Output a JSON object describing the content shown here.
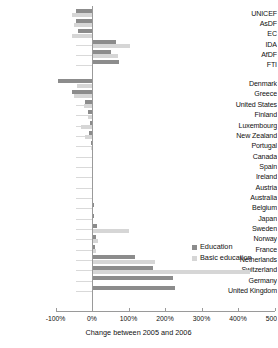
{
  "chart_data": {
    "type": "bar",
    "orientation": "horizontal",
    "title": "",
    "xlabel": "Change between 2005 and 2006",
    "ylabel": "",
    "xlim": [
      -100,
      500
    ],
    "xticks": [
      -100,
      0,
      100,
      200,
      300,
      400,
      500
    ],
    "xticklabels": [
      "-100%",
      "0%",
      "100%",
      "200%",
      "300%",
      "400%",
      "500%"
    ],
    "grid": false,
    "legend_position": "middle-right",
    "series": [
      {
        "name": "Education",
        "color": "#8c8c8c"
      },
      {
        "name": "Basic education",
        "color": "#d6d6d6"
      }
    ],
    "groups": [
      {
        "name": "agencies",
        "categories": [
          "UNICEF",
          "AsDF",
          "EC",
          "IDA",
          "AfDF",
          "FTI"
        ],
        "education": [
          -45,
          -45,
          -38,
          65,
          52,
          75
        ],
        "basic_education": [
          -55,
          -48,
          -55,
          105,
          72,
          0
        ]
      },
      {
        "name": "countries",
        "categories": [
          "Denmark",
          "Greece",
          "United States",
          "Finland",
          "Luxembourg",
          "New Zealand",
          "Portugal",
          "Canada",
          "Spain",
          "Ireland",
          "Austria",
          "Australia",
          "Belgium",
          "Japan",
          "Sweden",
          "Norway",
          "France",
          "Netherlands",
          "Switzerland",
          "Germany",
          "United Kingdom"
        ],
        "education": [
          -92,
          -55,
          -18,
          -12,
          -6,
          -8,
          -2,
          0,
          0,
          2,
          4,
          3,
          6,
          5,
          14,
          12,
          9,
          118,
          166,
          222,
          228
        ],
        "basic_education": [
          -42,
          -48,
          -22,
          -10,
          -30,
          -20,
          -3,
          0,
          0,
          1,
          2,
          2,
          3,
          4,
          100,
          16,
          10,
          172,
          432,
          0,
          0
        ]
      }
    ],
    "all_categories": [
      "UNICEF",
      "AsDF",
      "EC",
      "IDA",
      "AfDF",
      "FTI",
      "Denmark",
      "Greece",
      "United States",
      "Finland",
      "Luxembourg",
      "New Zealand",
      "Portugal",
      "Canada",
      "Spain",
      "Ireland",
      "Austria",
      "Australia",
      "Belgium",
      "Japan",
      "Sweden",
      "Norway",
      "France",
      "Netherlands",
      "Switzerland",
      "Germany",
      "United Kingdom"
    ]
  },
  "legend": {
    "items": [
      {
        "label": "Education",
        "swatch": "dark"
      },
      {
        "label": "Basic education",
        "swatch": "light"
      }
    ]
  },
  "axis": {
    "title": "Change between 2005 and 2006",
    "labels": [
      "-100%",
      "0%",
      "100%",
      "200%",
      "300%",
      "400%",
      "500%"
    ]
  }
}
